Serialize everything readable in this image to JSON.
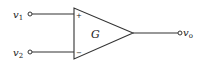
{
  "diagram": {
    "type": "op-amp / differential amplifier block",
    "gain_label": "G",
    "inputs": [
      {
        "name": "v",
        "subscript": "1",
        "polarity": "+"
      },
      {
        "name": "v",
        "subscript": "2",
        "polarity": "−"
      }
    ],
    "output": {
      "name": "v",
      "subscript": "o"
    },
    "colors": {
      "stroke": "#333333",
      "text": "#222222",
      "background": "#ffffff"
    }
  }
}
